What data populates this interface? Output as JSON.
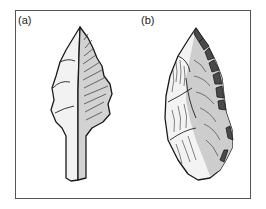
{
  "figure": {
    "panels": [
      {
        "label": "(a)",
        "subject": "tanged stone point"
      },
      {
        "label": "(b)",
        "subject": "retouched stone point"
      }
    ],
    "colors": {
      "frame": "#555555",
      "outline": "#1a1a1a",
      "light_face": "#f2f2f2",
      "shaded_face": "#cfcfcf",
      "retouch": "#4a4a4a"
    }
  }
}
